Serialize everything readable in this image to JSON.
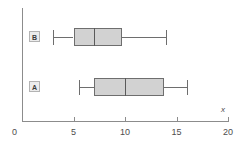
{
  "chart_data": {
    "type": "box",
    "title": "",
    "xlabel": "x",
    "ylabel": "",
    "orientation": "horizontal",
    "xlim": [
      0,
      20
    ],
    "grid": false,
    "legend": "none",
    "tick_labels": [
      "0",
      "5",
      "10",
      "15",
      "20"
    ],
    "tick_values": [
      0,
      5,
      10,
      15,
      20
    ],
    "categories": [
      "B",
      "A"
    ],
    "boxes": [
      {
        "label": "B",
        "min": 3.0,
        "q1": 5.0,
        "median": 7.0,
        "q3": 9.7,
        "max": 14.0
      },
      {
        "label": "A",
        "min": 5.5,
        "q1": 7.0,
        "median": 10.0,
        "q3": 13.8,
        "max": 16.0
      }
    ],
    "colors": {
      "box_fill": "#d2d2d2",
      "box_border": "#6e6e6e",
      "median": "#5a5a5a",
      "axis": "#8c8c8c",
      "text": "#4d4d4d",
      "label_badge_fill": "#ececec",
      "label_badge_border": "#b3b3b3"
    }
  },
  "axis": {
    "origin_label": "0",
    "x_axis_name": "x"
  }
}
